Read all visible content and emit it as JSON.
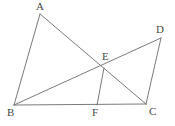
{
  "figure": {
    "type": "geometry-diagram",
    "width": 175,
    "height": 126,
    "background_color": "#ffffff",
    "stroke_color": "#6b6b6b",
    "label_color": "#4a4a4a",
    "points": [
      {
        "id": "A",
        "label": "A",
        "x": 40,
        "y": 14,
        "label_x": 36,
        "label_y": 1
      },
      {
        "id": "B",
        "label": "B",
        "x": 14,
        "y": 105,
        "label_x": 7,
        "label_y": 107
      },
      {
        "id": "C",
        "label": "C",
        "x": 146,
        "y": 104,
        "label_x": 149,
        "label_y": 106
      },
      {
        "id": "D",
        "label": "D",
        "x": 161,
        "y": 38,
        "label_x": 156,
        "label_y": 24
      },
      {
        "id": "E",
        "label": "E",
        "x": 104,
        "y": 68,
        "label_x": 102,
        "label_y": 51
      },
      {
        "id": "F",
        "label": "F",
        "x": 97,
        "y": 105,
        "label_x": 92,
        "label_y": 107
      }
    ],
    "segments": [
      {
        "id": "AB",
        "from": "A",
        "to": "B",
        "path": "M 40 14 L 14 105"
      },
      {
        "id": "AC",
        "from": "A",
        "to": "C",
        "path": "M 40 14 L 146 104"
      },
      {
        "id": "BC",
        "from": "B",
        "to": "C",
        "path": "M 14 105 L 146 104"
      },
      {
        "id": "BD",
        "from": "B",
        "to": "D",
        "path": "M 14 105 L 161 38"
      },
      {
        "id": "DC",
        "from": "D",
        "to": "C",
        "path": "M 161 38 L 146 104"
      },
      {
        "id": "EF",
        "from": "E",
        "to": "F",
        "path": "M 104 68 L 97 105"
      }
    ]
  }
}
